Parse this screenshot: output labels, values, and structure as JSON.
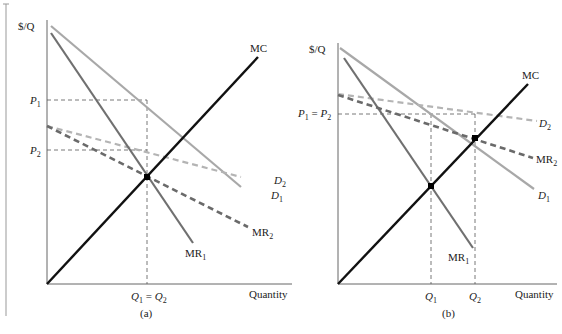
{
  "panels": {
    "a": {
      "caption": "(a)",
      "y_axis_label": "$/Q",
      "x_axis_label": "Quantity",
      "price_labels": {
        "p1": "P",
        "p1_sub": "1",
        "p2": "P",
        "p2_sub": "2"
      },
      "quantity_label": {
        "q1": "Q",
        "q1_sub": "1",
        "eq": " = ",
        "q2": "Q",
        "q2_sub": "2"
      },
      "curve_labels": {
        "mc": "MC",
        "d1": "D",
        "d1_sub": "1",
        "d2": "D",
        "d2_sub": "2",
        "mr1": "MR",
        "mr1_sub": "1",
        "mr2": "MR",
        "mr2_sub": "2"
      }
    },
    "b": {
      "caption": "(b)",
      "y_axis_label": "$/Q",
      "x_axis_label": "Quantity",
      "price_labels": {
        "p1": "P",
        "p1_sub": "1",
        "eq": " = ",
        "p2": "P",
        "p2_sub": "2"
      },
      "quantity_labels": {
        "q1": "Q",
        "q1_sub": "1",
        "q2": "Q",
        "q2_sub": "2"
      },
      "curve_labels": {
        "mc": "MC",
        "d1": "D",
        "d1_sub": "1",
        "d2": "D",
        "d2_sub": "2",
        "mr1": "MR",
        "mr1_sub": "1",
        "mr2": "MR",
        "mr2_sub": "2"
      }
    }
  },
  "colors": {
    "mc": "#111111",
    "d1": "#a8a8a8",
    "d2": "#b4b4b4",
    "mr1": "#707070",
    "mr2": "#6a6a6a",
    "axis": "#666666",
    "guide": "#555555"
  }
}
